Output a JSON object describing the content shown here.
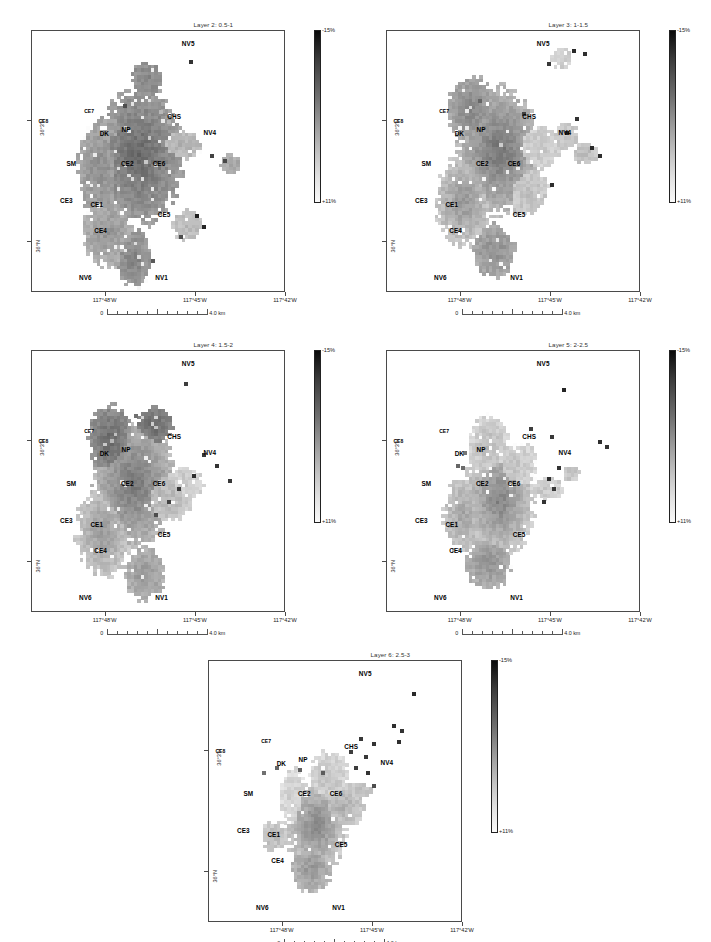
{
  "figure": {
    "caption": "Figure. Map panels of tomographic layers",
    "colorbar": {
      "max_label": "-15%",
      "min_label": "+11%",
      "max_value": 15,
      "min_value": 11,
      "unit": "%"
    },
    "scalebar": {
      "start_label": "0",
      "end_label": "4.0 km",
      "length_km": 4.0,
      "divisions": 10
    },
    "x_ticks": [
      "117°48'W",
      "117°45'W",
      "117°42'W"
    ],
    "y_ticks": [
      "36°3'N",
      "36°N"
    ],
    "site_labels": [
      "NV5",
      "CHS",
      "CE7",
      "CE8",
      "DK",
      "NP",
      "NV4",
      "SM",
      "CE2",
      "CE6",
      "CE3",
      "CE1",
      "CE5",
      "CE4",
      "NV6",
      "NV1"
    ]
  },
  "panels": [
    {
      "id": "layer2",
      "title": "Layer 2: 0.5-1",
      "layer": 2,
      "depth_range": "0.5-1"
    },
    {
      "id": "layer3",
      "title": "Layer 3: 1-1.5",
      "layer": 3,
      "depth_range": "1-1.5"
    },
    {
      "id": "layer4",
      "title": "Layer 4: 1.5-2",
      "layer": 4,
      "depth_range": "1.5-2"
    },
    {
      "id": "layer5",
      "title": "Layer 5: 2-2.5",
      "layer": 5,
      "depth_range": "2-2.5"
    },
    {
      "id": "layer6",
      "title": "Layer 6: 2.5-3",
      "layer": 6,
      "depth_range": "2.5-3"
    }
  ],
  "chart_data": {
    "type": "heatmap",
    "xlabel": "Longitude",
    "ylabel": "Latitude",
    "colorbar_range": [
      11,
      15
    ],
    "colorbar_unit": "%",
    "xlim": [
      "117°48'W",
      "117°42'W"
    ],
    "ylim": [
      "36°N",
      "36°3'N"
    ],
    "grid": false,
    "legend_position": "right",
    "panels": [
      {
        "name": "Layer 2: 0.5-1",
        "depth_km": [
          0.5,
          1.0
        ]
      },
      {
        "name": "Layer 3: 1-1.5",
        "depth_km": [
          1.0,
          1.5
        ]
      },
      {
        "name": "Layer 4: 1.5-2",
        "depth_km": [
          1.5,
          2.0
        ]
      },
      {
        "name": "Layer 5: 2-2.5",
        "depth_km": [
          2.0,
          2.5
        ]
      },
      {
        "name": "Layer 6: 2.5-3",
        "depth_km": [
          2.5,
          3.0
        ]
      }
    ]
  }
}
